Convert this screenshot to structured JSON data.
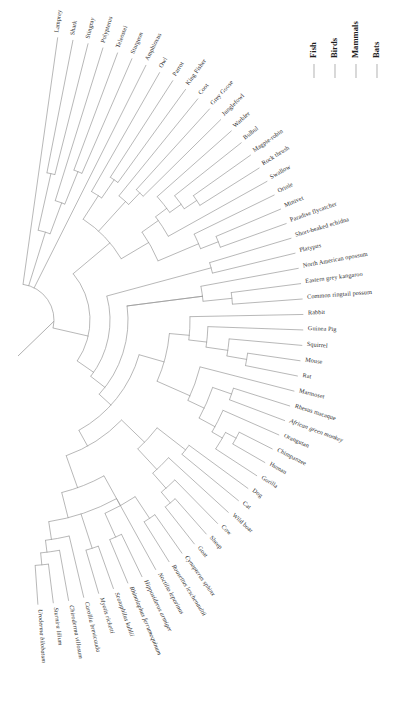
{
  "figure": {
    "type": "phylogenetic-tree",
    "layout": "fan",
    "background_color": "#ffffff",
    "branch_color": "#9a9a9a",
    "label_color": "#2b2b2b"
  },
  "legend": {
    "position": "top-right",
    "orientation": "vertical-text",
    "items": [
      {
        "label": "Fish",
        "color": "#b9b9b9"
      },
      {
        "label": "Birds",
        "color": "#b9b9b9"
      },
      {
        "label": "Mammals",
        "color": "#b9b9b9"
      },
      {
        "label": "Bats",
        "color": "#b9b9b9"
      }
    ]
  },
  "groups": [
    {
      "name": "Fish",
      "members": [
        "Lamprey",
        "Shark",
        "Stingray",
        "Polypterus",
        "Teleostei",
        "Sturgeon"
      ]
    },
    {
      "name": "Outgroup",
      "members": [
        "Amphioxus"
      ]
    },
    {
      "name": "Birds",
      "members": [
        "Owl",
        "Parrot",
        "King Fisher",
        "Coot",
        "Grey Goose",
        "Junglefowl",
        "Warbler",
        "Bulbul",
        "Magpie-robin",
        "Rock thrush",
        "Swallow",
        "Oriole",
        "Minivet",
        "Paradise flycatcher"
      ]
    },
    {
      "name": "Mammals",
      "members": [
        "Short-beaked echidna",
        "Platypus",
        "North American opossum",
        "Eastern grey kangaroo",
        "Common ringtail possum",
        "Rabbit",
        "Guinea Pig",
        "Squirrel",
        "Mouse",
        "Rat",
        "Marmoset",
        "Rhesus macaque",
        "African green monkey",
        "Orangutan",
        "Chimpanzee",
        "Human",
        "Gorilla",
        "Dog",
        "Cat",
        "Wild boar",
        "Cow",
        "Sheep",
        "Goat"
      ]
    },
    {
      "name": "Bats",
      "members": [
        "Cynopterus sphinx",
        "Rousettus leschenaultii",
        "Noctilio leporinus",
        "Hipposideros armiger",
        "Rhinolophus ferrumequinum",
        "Scotophilus kuhlii",
        "Myotis ricketti",
        "Carollia brevicauda",
        "Chiroderma villosum",
        "Sturnira lilium",
        "Uroderma bilobatum"
      ]
    }
  ],
  "tips": [
    {
      "name": "Lamprey",
      "group": "Fish",
      "italic": false
    },
    {
      "name": "Shark",
      "group": "Fish",
      "italic": false
    },
    {
      "name": "Stingray",
      "group": "Fish",
      "italic": false
    },
    {
      "name": "Polypterus",
      "group": "Fish",
      "italic": false
    },
    {
      "name": "Teleostei",
      "group": "Fish",
      "italic": false
    },
    {
      "name": "Sturgeon",
      "group": "Fish",
      "italic": false
    },
    {
      "name": "Amphioxus",
      "group": "Outgroup",
      "italic": false
    },
    {
      "name": "Owl",
      "group": "Birds",
      "italic": false
    },
    {
      "name": "Parrot",
      "group": "Birds",
      "italic": false
    },
    {
      "name": "King Fisher",
      "group": "Birds",
      "italic": false
    },
    {
      "name": "Coot",
      "group": "Birds",
      "italic": false
    },
    {
      "name": "Grey Goose",
      "group": "Birds",
      "italic": false
    },
    {
      "name": "Junglefowl",
      "group": "Birds",
      "italic": false
    },
    {
      "name": "Warbler",
      "group": "Birds",
      "italic": false
    },
    {
      "name": "Bulbul",
      "group": "Birds",
      "italic": false
    },
    {
      "name": "Magpie-robin",
      "group": "Birds",
      "italic": false
    },
    {
      "name": "Rock thrush",
      "group": "Birds",
      "italic": false
    },
    {
      "name": "Swallow",
      "group": "Birds",
      "italic": false
    },
    {
      "name": "Oriole",
      "group": "Birds",
      "italic": false
    },
    {
      "name": "Minivet",
      "group": "Birds",
      "italic": false
    },
    {
      "name": "Paradise flycatcher",
      "group": "Birds",
      "italic": false
    },
    {
      "name": "Short-beaked echidna",
      "group": "Mammals",
      "italic": false
    },
    {
      "name": "Platypus",
      "group": "Mammals",
      "italic": false
    },
    {
      "name": "North American opossum",
      "group": "Mammals",
      "italic": false
    },
    {
      "name": "Eastern grey kangaroo",
      "group": "Mammals",
      "italic": false
    },
    {
      "name": "Common ringtail possum",
      "group": "Mammals",
      "italic": false
    },
    {
      "name": "Rabbit",
      "group": "Mammals",
      "italic": false
    },
    {
      "name": "Guinea Pig",
      "group": "Mammals",
      "italic": false
    },
    {
      "name": "Squirrel",
      "group": "Mammals",
      "italic": false
    },
    {
      "name": "Mouse",
      "group": "Mammals",
      "italic": false
    },
    {
      "name": "Rat",
      "group": "Mammals",
      "italic": false
    },
    {
      "name": "Marmoset",
      "group": "Mammals",
      "italic": false
    },
    {
      "name": "Rhesus macaque",
      "group": "Mammals",
      "italic": false
    },
    {
      "name": "African green monkey",
      "group": "Mammals",
      "italic": true
    },
    {
      "name": "Orangutan",
      "group": "Mammals",
      "italic": false
    },
    {
      "name": "Chimpanzee",
      "group": "Mammals",
      "italic": false
    },
    {
      "name": "Human",
      "group": "Mammals",
      "italic": false
    },
    {
      "name": "Gorilla",
      "group": "Mammals",
      "italic": false
    },
    {
      "name": "Dog",
      "group": "Mammals",
      "italic": false
    },
    {
      "name": "Cat",
      "group": "Mammals",
      "italic": false
    },
    {
      "name": "Wild boar",
      "group": "Mammals",
      "italic": false
    },
    {
      "name": "Cow",
      "group": "Mammals",
      "italic": false
    },
    {
      "name": "Sheep",
      "group": "Mammals",
      "italic": false
    },
    {
      "name": "Goat",
      "group": "Mammals",
      "italic": false
    },
    {
      "name": "Cynopterus sphinx",
      "group": "Bats",
      "italic": true
    },
    {
      "name": "Rousettus leschenaultii",
      "group": "Bats",
      "italic": true
    },
    {
      "name": "Noctilio leporinus",
      "group": "Bats",
      "italic": true
    },
    {
      "name": "Hipposideros armiger",
      "group": "Bats",
      "italic": true
    },
    {
      "name": "Rhinolophus ferrumequinum",
      "group": "Bats",
      "italic": true
    },
    {
      "name": "Scotophilus kuhlii",
      "group": "Bats",
      "italic": true
    },
    {
      "name": "Myotis ricketti",
      "group": "Bats",
      "italic": true
    },
    {
      "name": "Carollia brevicauda",
      "group": "Bats",
      "italic": true
    },
    {
      "name": "Chiroderma villosum",
      "group": "Bats",
      "italic": true
    },
    {
      "name": "Sturnira lilium",
      "group": "Bats",
      "italic": true
    },
    {
      "name": "Uroderma bilobatum",
      "group": "Bats",
      "italic": true
    }
  ],
  "topology": {
    "newick_groups": [
      {
        "clade": "fish-cartilaginous",
        "members": [
          "Shark",
          "Stingray"
        ]
      },
      {
        "clade": "ray-finned",
        "members": [
          "Polypterus",
          "Teleostei",
          "Sturgeon"
        ]
      },
      {
        "clade": "passerines-A",
        "members": [
          "Warbler",
          "Bulbul",
          "Magpie-robin",
          "Rock thrush",
          "Swallow"
        ]
      },
      {
        "clade": "passerines-B",
        "members": [
          "Oriole",
          "Minivet",
          "Paradise flycatcher"
        ]
      },
      {
        "clade": "monotremes",
        "members": [
          "Short-beaked echidna",
          "Platypus"
        ]
      },
      {
        "clade": "marsupials",
        "members": [
          "North American opossum",
          "Eastern grey kangaroo",
          "Common ringtail possum"
        ]
      },
      {
        "clade": "rodents",
        "members": [
          "Squirrel",
          "Mouse",
          "Rat"
        ]
      },
      {
        "clade": "primates",
        "members": [
          "Marmoset",
          "Rhesus macaque",
          "African green monkey",
          "Orangutan",
          "Chimpanzee",
          "Human",
          "Gorilla"
        ]
      },
      {
        "clade": "carnivores",
        "members": [
          "Dog",
          "Cat"
        ]
      },
      {
        "clade": "artiodactyls",
        "members": [
          "Wild boar",
          "Cow",
          "Sheep",
          "Goat"
        ]
      },
      {
        "clade": "yinpterochiroptera",
        "members": [
          "Cynopterus sphinx",
          "Rousettus leschenaultii",
          "Hipposideros armiger",
          "Rhinolophus ferrumequinum"
        ]
      },
      {
        "clade": "yangochiroptera",
        "members": [
          "Noctilio leporinus",
          "Scotophilus kuhlii",
          "Myotis ricketti",
          "Carollia brevicauda",
          "Chiroderma villosum",
          "Sturnira lilium",
          "Uroderma bilobatum"
        ]
      }
    ]
  }
}
